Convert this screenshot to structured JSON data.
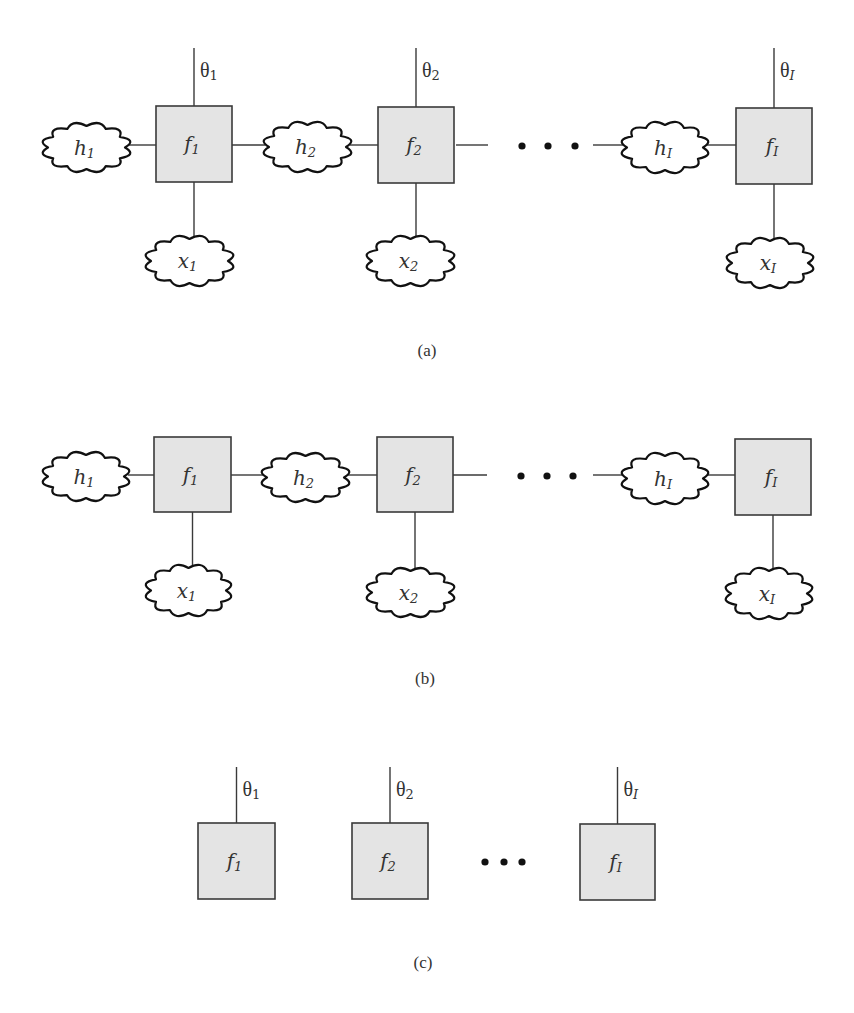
{
  "figure": {
    "width": 854,
    "height": 1013,
    "colors": {
      "box_fill": "#e4e4e4",
      "box_stroke": "#3a3a3a",
      "cloud_stroke": "#111111",
      "wire": "#3a3a3a",
      "text": "#333333"
    },
    "panels": [
      {
        "id": "a",
        "caption": "(a)",
        "caption_pos": [
          427,
          350
        ],
        "chain_y": 145,
        "ellipsis": {
          "dots_x": [
            522,
            548,
            575
          ],
          "y": 146,
          "line_left": [
            456,
            488
          ],
          "line_right": [
            593,
            623
          ]
        },
        "factors": [
          {
            "label": "f",
            "sub": "1",
            "sub_italic": false,
            "box": [
              156,
              106,
              76,
              76
            ],
            "theta": {
              "label": "θ",
              "sub": "1",
              "sub_italic": false,
              "top": 48
            },
            "x_cloud": {
              "label": "x",
              "sub": "1",
              "sub_italic": false,
              "box": [
                147,
                235,
                85,
                52
              ]
            }
          },
          {
            "label": "f",
            "sub": "2",
            "sub_italic": false,
            "box": [
              378,
              107,
              76,
              76
            ],
            "theta": {
              "label": "θ",
              "sub": "2",
              "sub_italic": false,
              "top": 48
            },
            "x_cloud": {
              "label": "x",
              "sub": "2",
              "sub_italic": false,
              "box": [
                368,
                235,
                85,
                52
              ]
            }
          },
          {
            "label": "f",
            "sub": "I",
            "sub_italic": true,
            "box": [
              736,
              108,
              76,
              76
            ],
            "theta": {
              "label": "θ",
              "sub": "I",
              "sub_italic": true,
              "top": 48
            },
            "x_cloud": {
              "label": "x",
              "sub": "I",
              "sub_italic": true,
              "box": [
                728,
                237,
                84,
                52
              ]
            }
          }
        ],
        "h_clouds": [
          {
            "label": "h",
            "sub": "1",
            "sub_italic": false,
            "box": [
              44,
              122,
              85,
              51
            ]
          },
          {
            "label": "h",
            "sub": "2",
            "sub_italic": false,
            "box": [
              265,
              121,
              85,
              52
            ]
          },
          {
            "label": "h",
            "sub": "I",
            "sub_italic": true,
            "box": [
              623,
              121,
              84,
              53
            ]
          }
        ]
      },
      {
        "id": "b",
        "caption": "(b)",
        "caption_pos": [
          425,
          678
        ],
        "chain_y": 475,
        "ellipsis": {
          "dots_x": [
            521,
            547,
            573
          ],
          "y": 476,
          "line_left": [
            453,
            487
          ],
          "line_right": [
            593,
            623
          ]
        },
        "factors": [
          {
            "label": "f",
            "sub": "1",
            "sub_italic": false,
            "box": [
              154,
              437,
              77,
              75
            ],
            "theta": null,
            "x_cloud": {
              "label": "x",
              "sub": "1",
              "sub_italic": false,
              "box": [
                147,
                564,
                83,
                53
              ]
            }
          },
          {
            "label": "f",
            "sub": "2",
            "sub_italic": false,
            "box": [
              377,
              437,
              76,
              75
            ],
            "theta": null,
            "x_cloud": {
              "label": "x",
              "sub": "2",
              "sub_italic": false,
              "box": [
                368,
                567,
                85,
                51
              ]
            }
          },
          {
            "label": "f",
            "sub": "I",
            "sub_italic": true,
            "box": [
              735,
              439,
              76,
              76
            ],
            "theta": null,
            "x_cloud": {
              "label": "x",
              "sub": "I",
              "sub_italic": true,
              "box": [
                727,
                567,
                84,
                53
              ]
            }
          }
        ],
        "h_clouds": [
          {
            "label": "h",
            "sub": "1",
            "sub_italic": false,
            "box": [
              44,
              451,
              84,
              51
            ]
          },
          {
            "label": "h",
            "sub": "2",
            "sub_italic": false,
            "box": [
              263,
              452,
              85,
              51
            ]
          },
          {
            "label": "h",
            "sub": "I",
            "sub_italic": true,
            "box": [
              623,
              452,
              84,
              53
            ]
          }
        ]
      },
      {
        "id": "c",
        "caption": "(c)",
        "caption_pos": [
          423,
          962
        ],
        "chain_y": null,
        "ellipsis": {
          "dots_x": [
            485,
            504,
            522
          ],
          "y": 862,
          "line_left": null,
          "line_right": null
        },
        "factors": [
          {
            "label": "f",
            "sub": "1",
            "sub_italic": false,
            "box": [
              198,
              823,
              77,
              76
            ],
            "theta": {
              "label": "θ",
              "sub": "1",
              "sub_italic": false,
              "top": 767
            },
            "x_cloud": null
          },
          {
            "label": "f",
            "sub": "2",
            "sub_italic": false,
            "box": [
              352,
              823,
              76,
              76
            ],
            "theta": {
              "label": "θ",
              "sub": "2",
              "sub_italic": false,
              "top": 767
            },
            "x_cloud": null
          },
          {
            "label": "f",
            "sub": "I",
            "sub_italic": true,
            "box": [
              580,
              824,
              75,
              76
            ],
            "theta": {
              "label": "θ",
              "sub": "I",
              "sub_italic": true,
              "top": 767
            },
            "x_cloud": null
          }
        ],
        "h_clouds": []
      }
    ]
  }
}
